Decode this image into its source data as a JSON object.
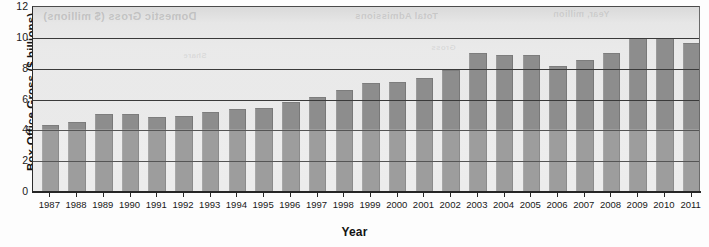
{
  "chart_data": {
    "type": "bar",
    "title": "",
    "xlabel": "Year",
    "ylabel": "Box-Office Gross ($ billions)",
    "ylim": [
      0,
      12
    ],
    "yticks": [
      0,
      2,
      4,
      6,
      8,
      10,
      12
    ],
    "grid": true,
    "legend": "none",
    "bar_color": "#8d8d8d",
    "plot_background": "#e9e9e9",
    "axis_color": "#262626",
    "categories": [
      "1987",
      "1988",
      "1989",
      "1990",
      "1991",
      "1992",
      "1993",
      "1994",
      "1995",
      "1996",
      "1997",
      "1998",
      "1999",
      "2000",
      "2001",
      "2002",
      "2003",
      "2004",
      "2005",
      "2006",
      "2007",
      "2008",
      "2009",
      "2010",
      "2011"
    ],
    "values": [
      4.25,
      4.45,
      5.0,
      5.0,
      4.8,
      4.85,
      5.15,
      5.3,
      5.4,
      5.8,
      6.1,
      6.55,
      7.0,
      7.1,
      7.3,
      7.85,
      8.95,
      8.8,
      8.8,
      8.1,
      8.5,
      8.95,
      9.9,
      9.9,
      9.6
    ]
  },
  "artifacts": {
    "note": "faint mirrored show-through text bleeding from the reverse side of the scanned page",
    "texts": [
      "Domestic Gross ($ millions)",
      "Total Admissions",
      "Year, million",
      "Share",
      "Gross"
    ]
  }
}
